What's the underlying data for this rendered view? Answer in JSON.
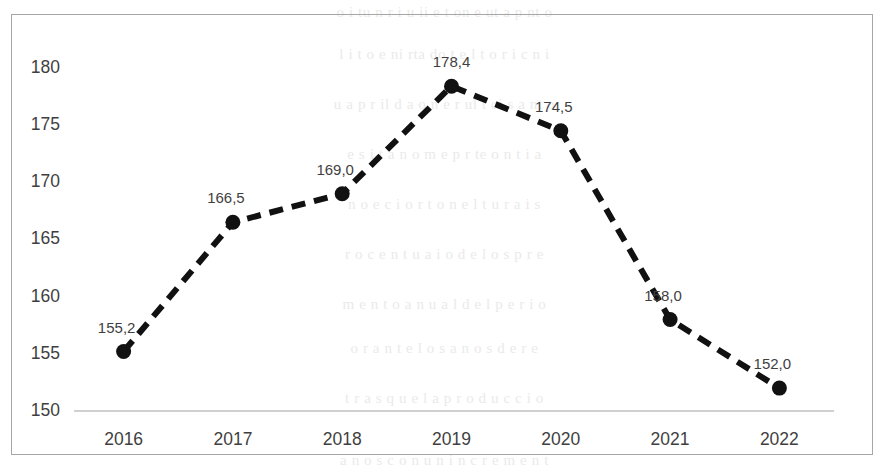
{
  "chart_data": {
    "type": "line",
    "title": "",
    "subtitle": "",
    "xlabel": "",
    "ylabel": "",
    "categories": [
      "2016",
      "2017",
      "2018",
      "2019",
      "2020",
      "2021",
      "2022"
    ],
    "values": [
      155.2,
      166.5,
      169.0,
      178.4,
      174.5,
      158.0,
      152.0
    ],
    "data_labels": [
      "155,2",
      "166,5",
      "169,0",
      "178,4",
      "174,5",
      "158,0",
      "152,0"
    ],
    "series": [
      {
        "name": "",
        "values": [
          155.2,
          166.5,
          169.0,
          178.4,
          174.5,
          158.0,
          152.0
        ],
        "line_style": "dashed",
        "line_color": "#1a1a1a",
        "marker": "circle",
        "marker_color": "#1a1a1a"
      }
    ],
    "ylim": [
      150,
      182
    ],
    "yticks": [
      "150",
      "155",
      "160",
      "165",
      "170",
      "175",
      "180"
    ],
    "ytick_values": [
      150,
      155,
      160,
      165,
      170,
      175,
      180
    ],
    "xtick_labels": [
      "2016",
      "2017",
      "2018",
      "2019",
      "2020",
      "2021",
      "2022"
    ],
    "grid": false,
    "legend": "none",
    "axis_line_color": "#d0d0d0",
    "border_color": "#a6a6a6",
    "decimal_separator": ","
  },
  "axis": {
    "y_labels": [
      "180",
      "175",
      "170",
      "165",
      "160",
      "155",
      "150"
    ],
    "x_labels": [
      "2016",
      "2017",
      "2018",
      "2019",
      "2020",
      "2021",
      "2022"
    ]
  },
  "ghost_text": {
    "lines": [
      "o  i  tu  n  r  i u  ii  e  t  on  e  ut  a  p  nt  o",
      "l  i  t o  e  ni   rta   do  t  e  l  t  o r  i  c  n  i",
      "u a  p  r  il  d  a   o n  e  r  ul t  ci   s  a  nt  o",
      "e  s  i  t  a  n    o  m  e    p  r  te  o  n  t  i  a",
      "n  o  e  c  i  o   r  t  o   n  e  l    t  u  r  a  i  s",
      "r  o  c  e  n t  u  a  i   o   d  e  l  o  s   p  r  e",
      "m  e  n  t  o   a  n  u  a  l    d  e  l   p  e r  i  o",
      "o  r  a  n  t  e   l  o  s   a  n  o  s   d  e   r  e",
      "t  r  a  s   q  u  e   l  a   p  r  o  d  u  c  c  i  o",
      "a  n  o  s   c  o  n   u  n   i  n  c  r  e  m  e  n  t"
    ]
  }
}
